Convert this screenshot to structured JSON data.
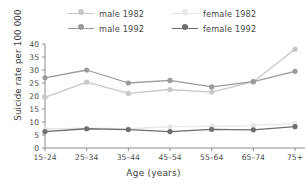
{
  "chart_data": {
    "type": "line",
    "title": "",
    "xlabel": "Age (years)",
    "ylabel": "Suicide rate per 100 000",
    "categories": [
      "15–24",
      "25–34",
      "35–44",
      "45–54",
      "55–64",
      "65–74",
      "75+"
    ],
    "ylim": [
      0,
      40
    ],
    "yticks": [
      0,
      5,
      10,
      15,
      20,
      25,
      30,
      35,
      40
    ],
    "grid": false,
    "legend_position": "top",
    "series": [
      {
        "name": "male 1982",
        "color": "#c8c8c8",
        "marker": "circle",
        "values": [
          19.5,
          25.3,
          21.0,
          22.5,
          21.5,
          25.5,
          38.0
        ]
      },
      {
        "name": "male 1992",
        "color": "#9a9a9a",
        "marker": "circle",
        "values": [
          27.0,
          30.0,
          25.0,
          26.0,
          23.5,
          25.5,
          29.5
        ]
      },
      {
        "name": "female 1982",
        "color": "#e6e6e6",
        "marker": "circle",
        "values": [
          7.3,
          7.6,
          7.4,
          8.2,
          8.3,
          8.6,
          9.4
        ]
      },
      {
        "name": "female 1992",
        "color": "#6e6e6e",
        "marker": "circle",
        "values": [
          6.3,
          7.4,
          7.1,
          6.3,
          7.2,
          7.0,
          8.2
        ]
      }
    ]
  },
  "legend": {
    "items": [
      {
        "label": "male 1982",
        "color": "#c8c8c8"
      },
      {
        "label": "female 1982",
        "color": "#e6e6e6"
      },
      {
        "label": "male 1992",
        "color": "#9a9a9a"
      },
      {
        "label": "female 1992",
        "color": "#6e6e6e"
      }
    ]
  },
  "axes": {
    "x_title": "Age (years)",
    "y_title": "Suicide rate per 100 000",
    "axis_color": "#8c8c8c"
  }
}
